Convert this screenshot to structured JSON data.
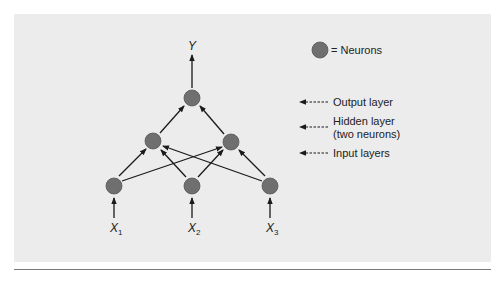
{
  "diagram": {
    "type": "feedforward-neural-network",
    "colors": {
      "background": "#ececec",
      "neuron_fill": "#6f6f6f",
      "neuron_stroke": "#555555",
      "edge": "#1a1a1a",
      "text": "#222222",
      "rule": "#7a7a7a"
    },
    "output_label": "Y",
    "inputs": [
      {
        "symbol": "X",
        "subscript": "1"
      },
      {
        "symbol": "X",
        "subscript": "2"
      },
      {
        "symbol": "X",
        "subscript": "3"
      }
    ],
    "nodes": {
      "output": [
        {
          "id": "o1",
          "x": 192,
          "y": 98
        }
      ],
      "hidden": [
        {
          "id": "h1",
          "x": 153,
          "y": 141
        },
        {
          "id": "h2",
          "x": 231,
          "y": 142
        }
      ],
      "input": [
        {
          "id": "i1",
          "x": 114,
          "y": 186
        },
        {
          "id": "i2",
          "x": 192,
          "y": 186
        },
        {
          "id": "i3",
          "x": 270,
          "y": 186
        }
      ]
    },
    "edges": [
      [
        "i1",
        "h1"
      ],
      [
        "i1",
        "h2"
      ],
      [
        "i2",
        "h1"
      ],
      [
        "i2",
        "h2"
      ],
      [
        "i3",
        "h1"
      ],
      [
        "i3",
        "h2"
      ],
      [
        "h1",
        "o1"
      ],
      [
        "h2",
        "o1"
      ]
    ],
    "legend": {
      "neuron_label": "= Neurons",
      "layers": [
        {
          "label_lines": [
            "Output layer"
          ]
        },
        {
          "label_lines": [
            "Hidden layer",
            "(two neurons)"
          ]
        },
        {
          "label_lines": [
            "Input layers"
          ]
        }
      ]
    }
  }
}
